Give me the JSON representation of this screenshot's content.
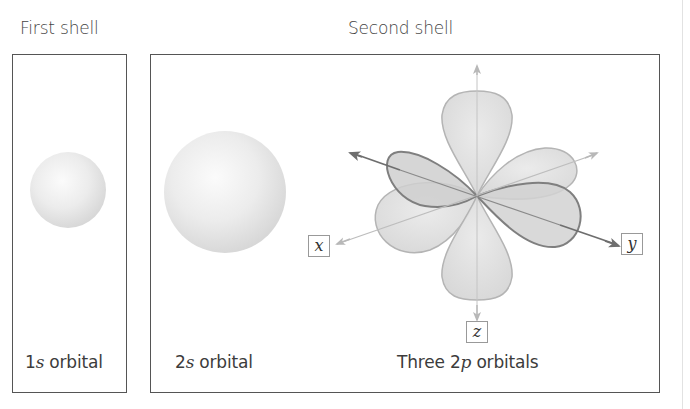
{
  "first_shell": {
    "title": "First shell",
    "orbital": {
      "prefix": "1",
      "letter": "s",
      "suffix": " orbital"
    }
  },
  "second_shell": {
    "title": "Second shell",
    "orbital_2s": {
      "prefix": "2",
      "letter": "s",
      "suffix": " orbital"
    },
    "orbital_2p": {
      "prefix": "Three 2",
      "letter": "p",
      "suffix": " orbitals"
    },
    "axes": {
      "x": "x",
      "y": "y",
      "z": "z"
    }
  },
  "colors": {
    "border": "#555555",
    "lobe_fill": "#dcdcdc",
    "lobe_stroke": "#b0b0b0",
    "dark_lobe_stroke": "#7a7a7a",
    "light_axis": "#b8b8b8",
    "dark_axis": "#6e6e6e"
  }
}
